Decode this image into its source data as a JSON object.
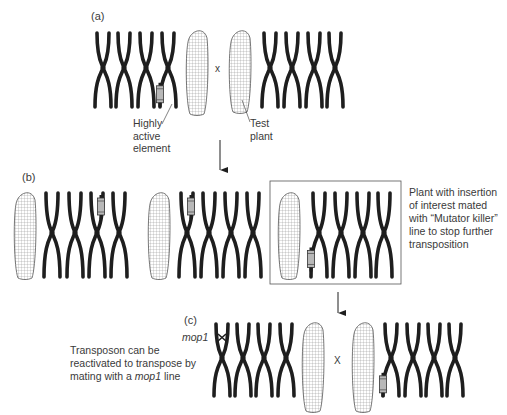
{
  "panels": {
    "a": {
      "label": "(a)",
      "cross_symbol": "x",
      "annotations": {
        "element_line1": "Highly",
        "element_line2": "active",
        "element_line3": "element",
        "test_line1": "Test",
        "test_line2": "plant"
      }
    },
    "b": {
      "label": "(b)",
      "note": {
        "line1": "Plant with insertion",
        "line2": "of interest mated",
        "line3": "with “Mutator killer”",
        "line4": "line to stop further",
        "line5": "transposition"
      }
    },
    "c": {
      "label": "(c)",
      "cross_symbol": "X",
      "mutant_label": "mop1",
      "note": {
        "line1": "Transposon can be",
        "line2": "reactivated to transpose by",
        "line3_prefix": "mating with a ",
        "line3_italic": "mop1",
        "line3_suffix": " line"
      }
    }
  },
  "colors": {
    "chromosome": "#1e1e1e",
    "element_fill": "#b8b8b8",
    "cob_stroke": "#555555",
    "box_stroke": "#555555",
    "text": "#3a3a3a"
  },
  "layout": {
    "rows": [
      {
        "id": "a",
        "chromosomes": [
          {
            "x": 103,
            "top": 33,
            "bottom": 107
          },
          {
            "x": 124,
            "top": 33,
            "bottom": 107
          },
          {
            "x": 146,
            "top": 33,
            "bottom": 107
          },
          {
            "x": 168,
            "top": 33,
            "bottom": 107,
            "element": "bottom"
          },
          {
            "x": 270,
            "top": 33,
            "bottom": 107
          },
          {
            "x": 292,
            "top": 33,
            "bottom": 107
          },
          {
            "x": 314,
            "top": 33,
            "bottom": 107
          },
          {
            "x": 335,
            "top": 33,
            "bottom": 107
          }
        ],
        "cobs": [
          {
            "x": 186,
            "y": 28,
            "w": 22,
            "h": 86
          },
          {
            "x": 229,
            "y": 28,
            "w": 22,
            "h": 84
          }
        ]
      },
      {
        "id": "b",
        "chromosomes": [
          {
            "x": 52,
            "top": 193,
            "bottom": 277
          },
          {
            "x": 75,
            "top": 193,
            "bottom": 277
          },
          {
            "x": 97,
            "top": 193,
            "bottom": 277,
            "element": "top"
          },
          {
            "x": 119,
            "top": 193,
            "bottom": 277
          },
          {
            "x": 187,
            "top": 193,
            "bottom": 277,
            "element": "top"
          },
          {
            "x": 209,
            "top": 193,
            "bottom": 277
          },
          {
            "x": 231,
            "top": 193,
            "bottom": 277
          },
          {
            "x": 253,
            "top": 193,
            "bottom": 277
          },
          {
            "x": 319,
            "top": 193,
            "bottom": 277,
            "element": "bottom"
          },
          {
            "x": 341,
            "top": 193,
            "bottom": 277
          },
          {
            "x": 363,
            "top": 193,
            "bottom": 277
          },
          {
            "x": 384,
            "top": 193,
            "bottom": 277
          }
        ],
        "cobs": [
          {
            "x": 14,
            "y": 190,
            "w": 22,
            "h": 88
          },
          {
            "x": 148,
            "y": 190,
            "w": 22,
            "h": 88
          },
          {
            "x": 278,
            "y": 190,
            "w": 22,
            "h": 88
          }
        ]
      },
      {
        "id": "c",
        "chromosomes": [
          {
            "x": 222,
            "top": 324,
            "bottom": 396,
            "element": "mop1"
          },
          {
            "x": 243,
            "top": 324,
            "bottom": 396
          },
          {
            "x": 264,
            "top": 324,
            "bottom": 396
          },
          {
            "x": 286,
            "top": 324,
            "bottom": 396
          },
          {
            "x": 391,
            "top": 324,
            "bottom": 396,
            "element": "bottom"
          },
          {
            "x": 413,
            "top": 324,
            "bottom": 396
          },
          {
            "x": 434,
            "top": 324,
            "bottom": 396
          },
          {
            "x": 455,
            "top": 324,
            "bottom": 396
          }
        ],
        "cobs": [
          {
            "x": 302,
            "y": 320,
            "w": 22,
            "h": 91
          },
          {
            "x": 352,
            "y": 320,
            "w": 22,
            "h": 91
          }
        ]
      }
    ]
  }
}
